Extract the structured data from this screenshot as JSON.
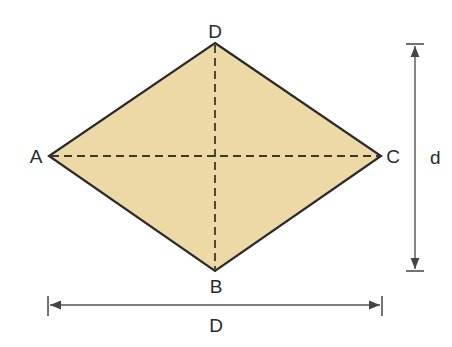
{
  "diagram": {
    "type": "rhombus",
    "fill_color": "#ecd9a6",
    "stroke_color": "#2a2a2a",
    "vertices": {
      "A": {
        "label": "A",
        "x": 49,
        "y": 156
      },
      "B": {
        "label": "B",
        "x": 215,
        "y": 271
      },
      "C": {
        "label": "C",
        "x": 381,
        "y": 156
      },
      "D": {
        "label": "D",
        "x": 215,
        "y": 43
      }
    },
    "diagonals": [
      {
        "from": "A",
        "to": "C",
        "style": "dashed"
      },
      {
        "from": "D",
        "to": "B",
        "style": "dashed"
      }
    ],
    "dimensions": {
      "vertical": {
        "label": "d",
        "x": 415,
        "y1": 44,
        "y2": 271
      },
      "horizontal": {
        "label": "D",
        "y": 305,
        "x1": 48,
        "x2": 382
      }
    }
  }
}
